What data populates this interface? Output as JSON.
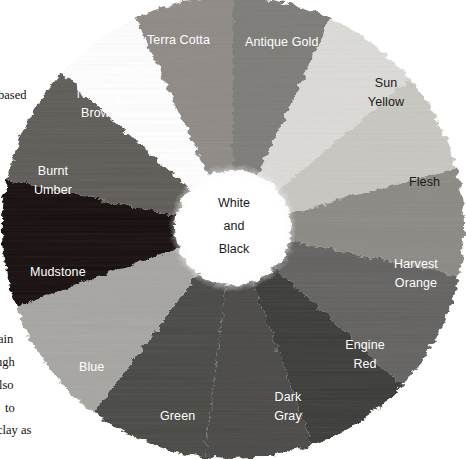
{
  "figure": {
    "name": "pigment-color-wheel",
    "center": {
      "x": 233,
      "y": 228
    },
    "outer_radius": 231,
    "inner_radius": 58,
    "background": "#ffffff",
    "hub": {
      "line1": "White",
      "line2": "and",
      "line3": "Black",
      "text_color": "#1a1a1a",
      "fill": "#ffffff"
    },
    "wedges": [
      {
        "id": "terra-cotta",
        "label": "Terra Cotta",
        "label_lines": [
          "Terra Cotta"
        ],
        "color": "#8f8a86",
        "text_color": "#ffffff",
        "start_angle": -115,
        "end_angle": -90,
        "label_x": 147,
        "label_y": 31
      },
      {
        "id": "antique-gold",
        "label": "Antique Gold",
        "label_lines": [
          "Antique Gold"
        ],
        "color": "#7e7b78",
        "text_color": "#ffffff",
        "start_angle": -90,
        "end_angle": -65,
        "label_x": 245,
        "label_y": 33
      },
      {
        "id": "sun-yellow",
        "label": "Sun Yellow",
        "label_lines": [
          "Sun",
          "Yellow"
        ],
        "color": "#dcdbd7",
        "text_color": "#1a1a1a",
        "start_angle": -65,
        "end_angle": -40,
        "label_x": 360,
        "label_y": 74
      },
      {
        "id": "flesh",
        "label": "Flesh",
        "label_lines": [
          "Flesh"
        ],
        "color": "#c9c7c2",
        "text_color": "#1a1a1a",
        "start_angle": -40,
        "end_angle": -15,
        "label_x": 409,
        "label_y": 173
      },
      {
        "id": "harvest-orange",
        "label": "Harvest Orange",
        "label_lines": [
          "Harvest",
          "Orange"
        ],
        "color": "#8d8a85",
        "text_color": "#ffffff",
        "start_angle": -15,
        "end_angle": 12,
        "label_x": 388,
        "label_y": 255
      },
      {
        "id": "engine-red",
        "label": "Engine Red",
        "label_lines": [
          "Engine",
          "Red"
        ],
        "color": "#646260",
        "text_color": "#ffffff",
        "start_angle": 12,
        "end_angle": 43,
        "label_x": 340,
        "label_y": 336
      },
      {
        "id": "dark-gray",
        "label": "Dark Gray",
        "label_lines": [
          "Dark",
          "Gray"
        ],
        "color": "#3b3a39",
        "text_color": "#ffffff",
        "start_angle": 43,
        "end_angle": 70,
        "label_x": 266,
        "label_y": 388
      },
      {
        "id": "green",
        "label": "Green",
        "label_lines": [
          "Green"
        ],
        "color": "#4b4a47",
        "text_color": "#ffffff",
        "start_angle": 70,
        "end_angle": 97,
        "label_x": 160,
        "label_y": 407
      },
      {
        "id": "blue",
        "label": "Blue",
        "label_lines": [
          "Blue"
        ],
        "color": "#494845",
        "text_color": "#ffffff",
        "start_angle": 97,
        "end_angle": 127,
        "label_x": 79,
        "label_y": 358
      },
      {
        "id": "mudstone",
        "label": "Mudstone",
        "label_lines": [
          "Mudstone"
        ],
        "color": "#a8a6a2",
        "text_color": "#ffffff",
        "start_angle": 127,
        "end_angle": 160,
        "label_x": 30,
        "label_y": 263
      },
      {
        "id": "burnt-umber",
        "label": "Burnt Umber",
        "label_lines": [
          "Burnt",
          "Umber"
        ],
        "color": "#121110",
        "text_color": "#ffffff",
        "start_angle": 160,
        "end_angle": 192,
        "label_x": 26,
        "label_y": 162
      },
      {
        "id": "nutmeg-brown",
        "label": "Nutmeg Brown",
        "label_lines": [
          "Nutmeg",
          "Brown"
        ],
        "color": "#5e5c59",
        "text_color": "#ffffff",
        "start_angle": 192,
        "end_angle": 222,
        "label_x": 69,
        "label_y": 85
      }
    ]
  },
  "margin_text": [
    {
      "id": "frag-based",
      "text": "based",
      "x": -2,
      "y": 88
    },
    {
      "id": "frag-ain",
      "text": "ain",
      "x": -2,
      "y": 332
    },
    {
      "id": "frag-ugh",
      "text": "ugh",
      "x": -4,
      "y": 355
    },
    {
      "id": "frag-lso",
      "text": "lso",
      "x": -1,
      "y": 378
    },
    {
      "id": "frag-to",
      "text": "to",
      "x": 5,
      "y": 401
    },
    {
      "id": "frag-clayas",
      "text": "clay as",
      "x": -3,
      "y": 423
    }
  ]
}
